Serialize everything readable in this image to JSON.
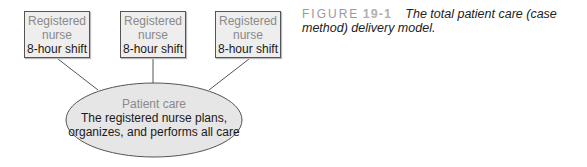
{
  "diagram": {
    "nurse_boxes": [
      {
        "line1": "Registered",
        "line2": "nurse",
        "line3": "8-hour shift"
      },
      {
        "line1": "Registered",
        "line2": "nurse",
        "line3": "8-hour shift"
      },
      {
        "line1": "Registered",
        "line2": "nurse",
        "line3": "8-hour shift"
      }
    ],
    "patient_care": {
      "title": "Patient care",
      "line2": "The registered nurse plans,",
      "line3": "organizes, and performs all care"
    },
    "colors": {
      "box_fill": "#eeeeee",
      "ellipse_fill": "#e6e6e6",
      "stroke": "#555555"
    }
  },
  "caption": {
    "figure_label": "FIGURE",
    "figure_number": "19-1",
    "text": "The total patient care (case method) delivery model."
  }
}
